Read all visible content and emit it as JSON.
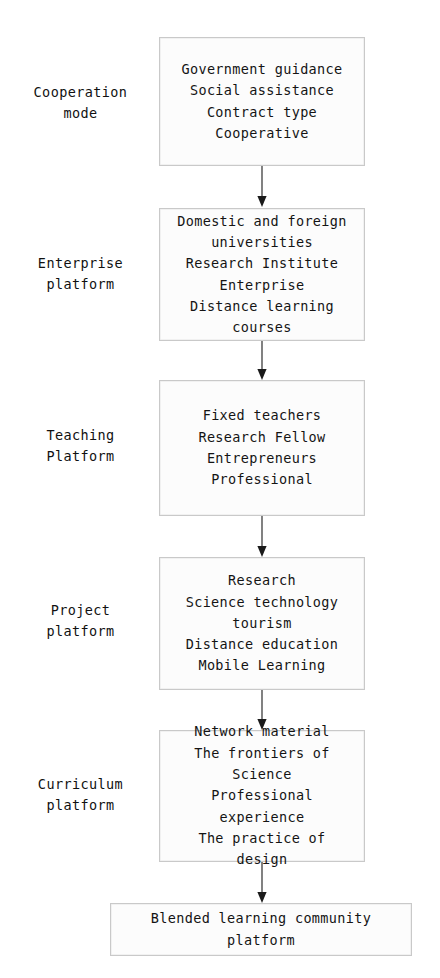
{
  "diagram": {
    "orientation": "top-to-bottom",
    "accent_color": "#1a1a1a",
    "box_fill": "#fcfcfc",
    "box_border": "#c9c9c9",
    "stages": [
      {
        "label": "Cooperation\nmode",
        "box_text": "Government guidance\nSocial assistance\nContract type\nCooperative",
        "items": [
          "Government guidance",
          "Social assistance",
          "Contract type",
          "Cooperative"
        ]
      },
      {
        "label": "Enterprise\nplatform",
        "box_text": "Domestic and foreign\nuniversities\nResearch Institute\nEnterprise\nDistance learning\ncourses",
        "items": [
          "Domestic and foreign universities",
          "Research Institute",
          "Enterprise",
          "Distance learning courses"
        ]
      },
      {
        "label": "Teaching\nPlatform",
        "box_text": "Fixed teachers\nResearch Fellow\nEntrepreneurs\nProfessional",
        "items": [
          "Fixed teachers",
          "Research Fellow",
          "Entrepreneurs",
          "Professional"
        ]
      },
      {
        "label": "Project\nplatform",
        "box_text": "Research\nScience technology\ntourism\nDistance education\nMobile Learning",
        "items": [
          "Research",
          "Science technology tourism",
          "Distance education",
          "Mobile Learning"
        ]
      },
      {
        "label": "Curriculum\nplatform",
        "box_text": "Network material\nThe frontiers of\nScience\nProfessional\nexperience\nThe practice of\ndesign",
        "items": [
          "Network material",
          "The frontiers of Science",
          "Professional experience",
          "The practice of design"
        ]
      }
    ],
    "final": {
      "label": "",
      "box_text": "Blended learning community\nplatform"
    },
    "arrow_count": 6
  }
}
